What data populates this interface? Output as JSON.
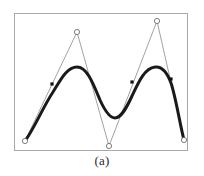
{
  "figure": {
    "caption": "(a)",
    "frame": {
      "x": 14,
      "y": 13,
      "width": 174,
      "height": 138,
      "border_color": "#a8a8a8"
    },
    "background_color": "#ffffff"
  },
  "chart_data": {
    "type": "line",
    "title": "",
    "subtitle": "",
    "xlabel": "",
    "ylabel": "",
    "caption": "(a)",
    "grid": false,
    "legend": "none",
    "axis_visible": false,
    "xlim": [
      14,
      188
    ],
    "ylim": [
      13,
      151
    ],
    "note": "B-spline approximation: thin gray control polygon with open circular control points, thick black smooth curve, filled square markers on curve",
    "series": [
      {
        "name": "control-polygon",
        "type": "line",
        "color": "#8a8a8a",
        "line_width": 0.8,
        "marker": "open-circle",
        "marker_color": "#ffffff",
        "marker_edge_color": "#6e6e6e",
        "marker_size": 3.4,
        "x": [
          24,
          76,
          108,
          156,
          183
        ],
        "y": [
          140,
          31,
          145,
          20,
          139
        ],
        "points": [
          {
            "x": 24,
            "y": 140,
            "label": "P0"
          },
          {
            "x": 76,
            "y": 31,
            "label": "P1"
          },
          {
            "x": 108,
            "y": 145,
            "label": "P2"
          },
          {
            "x": 156,
            "y": 20,
            "label": "P3"
          },
          {
            "x": 183,
            "y": 139,
            "label": "P4"
          }
        ]
      },
      {
        "name": "approximating-curve",
        "type": "line",
        "color": "#1a1a1a",
        "line_width": 3.0,
        "marker": "none",
        "x": [
          24,
          36,
          48,
          58,
          68,
          78,
          88,
          96,
          104,
          112,
          120,
          130,
          140,
          150,
          160,
          170,
          180,
          183
        ],
        "y": [
          140,
          117,
          96,
          82,
          72,
          67,
          70,
          81,
          97,
          110,
          115,
          108,
          91,
          75,
          66,
          66,
          118,
          139
        ]
      },
      {
        "name": "curve-knot-markers",
        "type": "scatter",
        "color": "#111111",
        "marker": "filled-square",
        "marker_size": 3.2,
        "points": [
          {
            "x": 51,
            "y": 83
          },
          {
            "x": 131,
            "y": 81
          },
          {
            "x": 170,
            "y": 78
          }
        ]
      }
    ]
  }
}
